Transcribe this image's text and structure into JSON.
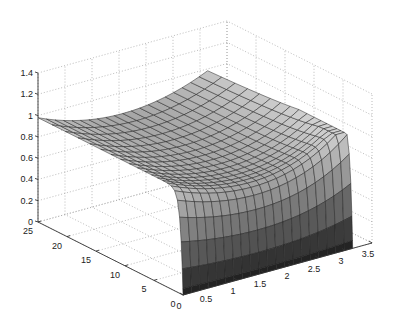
{
  "chart_data": {
    "type": "surface3d",
    "title": "",
    "xlabel": "",
    "ylabel": "",
    "zlabel": "",
    "grid": true,
    "colormap": "gray",
    "view": "MATLAB default 3-D view (az -37.5, el 30)",
    "xlim": [
      0,
      3.5
    ],
    "ylim": [
      0,
      25
    ],
    "zlim": [
      0,
      1.4
    ],
    "x_ticks": [
      "0",
      "0.5",
      "1",
      "1.5",
      "2",
      "2.5",
      "3",
      "3.5"
    ],
    "y_ticks": [
      "0",
      "5",
      "10",
      "15",
      "20",
      "25"
    ],
    "z_ticks": [
      "0",
      "0.2",
      "0.4",
      "0.6",
      "0.8",
      "1",
      "1.2",
      "1.4"
    ],
    "surface_description": "Saddle-like surface over x in [0, 3.14], y in [0, 25]. Near y=0 the surface drops sharply to z=0 along the whole x range (vertical wall). For larger y the surface is a shallow trough with z ~0.8 in the middle of x, rising to ~1.0 at x=0 and to ~1.0 at x=3.14.",
    "sample_points": [
      {
        "x": 0,
        "y": 25,
        "z": 0.98
      },
      {
        "x": 1.57,
        "y": 25,
        "z": 0.8
      },
      {
        "x": 3.14,
        "y": 25,
        "z": 0.98
      },
      {
        "x": 0,
        "y": 1,
        "z": 0.72
      },
      {
        "x": 1.57,
        "y": 1,
        "z": 0.62
      },
      {
        "x": 3.14,
        "y": 1,
        "z": 0.98
      },
      {
        "x": 0,
        "y": 0,
        "z": 0.0
      },
      {
        "x": 1.57,
        "y": 0,
        "z": 0.0
      },
      {
        "x": 3.14,
        "y": 0,
        "z": 0.0
      }
    ]
  }
}
